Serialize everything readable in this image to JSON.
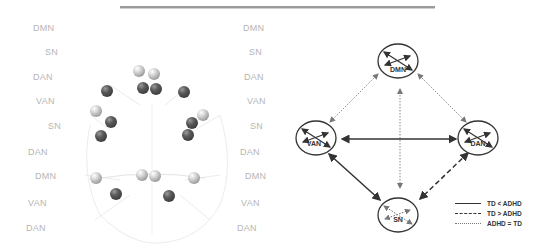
{
  "left_panel": {
    "labels_left": [
      {
        "text": "DMN",
        "x": 33,
        "y": 29
      },
      {
        "text": "SN",
        "x": 45,
        "y": 53
      },
      {
        "text": "DAN",
        "x": 33,
        "y": 78
      },
      {
        "text": "VAN",
        "x": 36,
        "y": 102
      },
      {
        "text": "SN",
        "x": 48,
        "y": 127
      },
      {
        "text": "DAN",
        "x": 28,
        "y": 153
      },
      {
        "text": "DMN",
        "x": 35,
        "y": 177
      },
      {
        "text": "VAN",
        "x": 28,
        "y": 204
      },
      {
        "text": "DAN",
        "x": 26,
        "y": 229
      }
    ],
    "labels_right": [
      {
        "text": "DMN",
        "x": 243,
        "y": 29
      },
      {
        "text": "SN",
        "x": 249,
        "y": 53
      },
      {
        "text": "DAN",
        "x": 244,
        "y": 78
      },
      {
        "text": "VAN",
        "x": 247,
        "y": 102
      },
      {
        "text": "SN",
        "x": 250,
        "y": 127
      },
      {
        "text": "DAN",
        "x": 240,
        "y": 153
      },
      {
        "text": "DMN",
        "x": 245,
        "y": 177
      },
      {
        "text": "VAN",
        "x": 241,
        "y": 204
      },
      {
        "text": "DAN",
        "x": 237,
        "y": 229
      }
    ],
    "spheres": [
      {
        "x": 139,
        "y": 71,
        "tone": "light"
      },
      {
        "x": 154,
        "y": 74,
        "tone": "light"
      },
      {
        "x": 143,
        "y": 88,
        "tone": "dark"
      },
      {
        "x": 156,
        "y": 89,
        "tone": "dark"
      },
      {
        "x": 107,
        "y": 91,
        "tone": "dark"
      },
      {
        "x": 184,
        "y": 92,
        "tone": "dark"
      },
      {
        "x": 96,
        "y": 111,
        "tone": "light"
      },
      {
        "x": 203,
        "y": 115,
        "tone": "light"
      },
      {
        "x": 111,
        "y": 122,
        "tone": "dark"
      },
      {
        "x": 192,
        "y": 123,
        "tone": "dark"
      },
      {
        "x": 101,
        "y": 136,
        "tone": "dark"
      },
      {
        "x": 188,
        "y": 135,
        "tone": "dark"
      },
      {
        "x": 96,
        "y": 178,
        "tone": "light"
      },
      {
        "x": 142,
        "y": 175,
        "tone": "light"
      },
      {
        "x": 155,
        "y": 176,
        "tone": "light"
      },
      {
        "x": 194,
        "y": 178,
        "tone": "light"
      },
      {
        "x": 116,
        "y": 194,
        "tone": "dark"
      },
      {
        "x": 169,
        "y": 196,
        "tone": "dark"
      }
    ]
  },
  "network_diagram": {
    "nodes": [
      {
        "id": "DMN",
        "label": "DMN",
        "cx": 128,
        "cy": 61
      },
      {
        "id": "VAN",
        "label": "VAN",
        "cx": 46,
        "cy": 138
      },
      {
        "id": "DAN",
        "label": "DAN",
        "cx": 208,
        "cy": 138
      },
      {
        "id": "SN",
        "label": "SN",
        "cx": 128,
        "cy": 215
      }
    ],
    "edges": [
      {
        "from": "DMN",
        "to": "VAN",
        "style": "dotted"
      },
      {
        "from": "DMN",
        "to": "DAN",
        "style": "dotted"
      },
      {
        "from": "DMN",
        "to": "SN",
        "style": "dotted"
      },
      {
        "from": "VAN",
        "to": "DAN",
        "style": "solid"
      },
      {
        "from": "VAN",
        "to": "SN",
        "style": "solid"
      },
      {
        "from": "DAN",
        "to": "SN",
        "style": "dashed"
      }
    ],
    "legend": [
      {
        "style": "solid",
        "label": "TD < ADHD"
      },
      {
        "style": "dashed",
        "label": "TD > ADHD"
      },
      {
        "style": "dotted",
        "label": "ADHD = TD"
      }
    ]
  }
}
